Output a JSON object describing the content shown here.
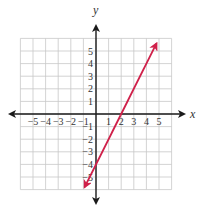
{
  "chart_data": {
    "type": "line",
    "title": "",
    "xlabel": "x",
    "ylabel": "y",
    "xlim": [
      -6,
      6
    ],
    "ylim": [
      -6,
      6
    ],
    "grid": true,
    "x_ticks": [
      "-5",
      "-4",
      "-3",
      "-2",
      "-1",
      "1",
      "2",
      "3",
      "4",
      "5"
    ],
    "y_ticks": [
      "5",
      "4",
      "3",
      "2",
      "1",
      "-1",
      "-2",
      "-3",
      "-4",
      "-5"
    ],
    "series": [
      {
        "name": "y = 2x - 4",
        "color": "#d0204a",
        "x": [
          -0.9,
          0,
          2,
          4.8
        ],
        "y": [
          -5.8,
          -4,
          0,
          5.6
        ],
        "arrows_both_ends": true
      }
    ]
  },
  "labels": {
    "x_axis": "x",
    "y_axis": "y"
  },
  "colors": {
    "line": "#d0204a",
    "grid": "#c8c8c8",
    "axis": "#1a1a1a"
  }
}
